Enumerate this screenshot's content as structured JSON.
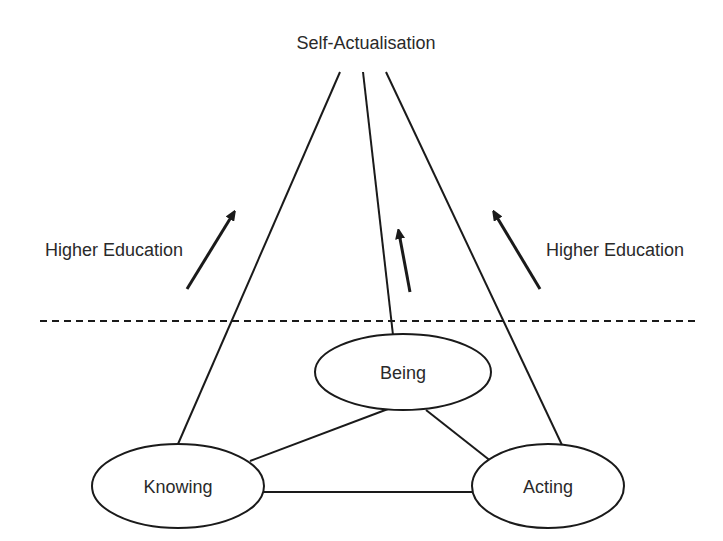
{
  "diagram": {
    "apex_label": "Self-Actualisation",
    "side_label_left": "Higher Education",
    "side_label_right": "Higher Education",
    "nodes": [
      {
        "id": "being",
        "label": "Being"
      },
      {
        "id": "knowing",
        "label": "Knowing"
      },
      {
        "id": "acting",
        "label": "Acting"
      }
    ],
    "edges": [
      {
        "from": "knowing",
        "to": "being"
      },
      {
        "from": "being",
        "to": "acting"
      },
      {
        "from": "knowing",
        "to": "acting"
      },
      {
        "from": "knowing",
        "to": "self-actualisation"
      },
      {
        "from": "being",
        "to": "self-actualisation"
      },
      {
        "from": "acting",
        "to": "self-actualisation"
      }
    ],
    "divider": "dashed",
    "arrows": [
      "up-right",
      "up",
      "up-left"
    ],
    "colors": {
      "line": "#1a1a1a",
      "text": "#2a2a2a",
      "background": "#ffffff"
    }
  }
}
